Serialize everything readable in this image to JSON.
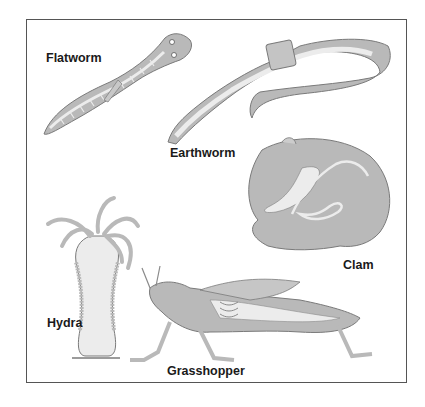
{
  "figure": {
    "colors": {
      "body_fill": "#b9b9b9",
      "inner_fill": "#ececec",
      "outline": "#7a7a7a",
      "frame": "#555555",
      "text": "#1a1a1a"
    },
    "organisms": [
      {
        "id": "flatworm",
        "label": "Flatworm"
      },
      {
        "id": "earthworm",
        "label": "Earthworm"
      },
      {
        "id": "clam",
        "label": "Clam"
      },
      {
        "id": "hydra",
        "label": "Hydra"
      },
      {
        "id": "grasshopper",
        "label": "Grasshopper"
      }
    ]
  }
}
